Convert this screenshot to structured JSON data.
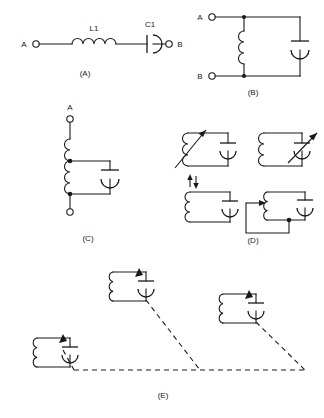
{
  "figure": {
    "line_color": "#1a1a1a",
    "background_color": "#ffffff"
  },
  "panels": [
    {
      "id": "A",
      "caption": "(A)",
      "description": "Series resonant circuit between terminals A and B",
      "terminals": [
        "A",
        "B"
      ],
      "components": [
        {
          "ref": "L1",
          "type": "inductor"
        },
        {
          "ref": "C1",
          "type": "capacitor"
        }
      ]
    },
    {
      "id": "B",
      "caption": "(B)",
      "description": "Parallel resonant tank across terminals A and B",
      "terminals": [
        "A",
        "B"
      ],
      "components": [
        {
          "ref": "",
          "type": "inductor"
        },
        {
          "ref": "",
          "type": "capacitor"
        }
      ]
    },
    {
      "id": "C",
      "caption": "(C)",
      "description": "Tapped inductor with capacitor across lower section",
      "terminals": [
        "A"
      ],
      "components": [
        {
          "ref": "",
          "type": "tapped-inductor"
        },
        {
          "ref": "",
          "type": "capacitor"
        }
      ]
    },
    {
      "id": "D",
      "caption": "(D)",
      "description": "Four methods of tuning a parallel tank circuit",
      "terminals": [],
      "variants": [
        {
          "name": "variable-inductor",
          "note": "arrow through coil"
        },
        {
          "name": "variable-capacitor",
          "note": "arrow through capacitor"
        },
        {
          "name": "permeability-tuned-inductor",
          "note": "slug arrows above coil"
        },
        {
          "name": "sliding-tap-inductor",
          "note": "movable tap contact on coil"
        }
      ]
    },
    {
      "id": "E",
      "caption": "(E)",
      "description": "Three tank circuits with ganged variable capacitors joined by dashed mechanical coupling",
      "terminals": [],
      "stages": [
        {
          "name": "stage-1",
          "component": "variable-capacitor"
        },
        {
          "name": "stage-2",
          "component": "variable-capacitor"
        },
        {
          "name": "stage-3",
          "component": "variable-capacitor"
        }
      ]
    }
  ],
  "labels": {
    "terminal_a": "A",
    "terminal_b": "B",
    "l1": "L1",
    "c1": "C1",
    "caption_a": "(A)",
    "caption_b": "(B)",
    "caption_c": "(C)",
    "caption_d": "(D)",
    "caption_e": "(E)"
  }
}
